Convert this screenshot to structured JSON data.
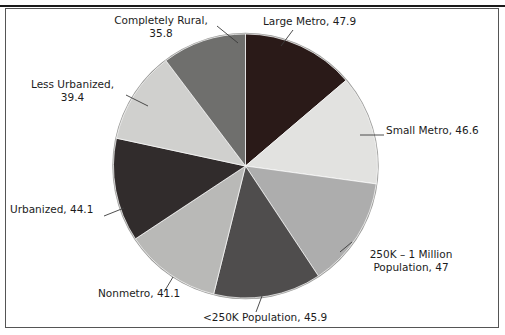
{
  "figure": {
    "clipped_header_text": "",
    "background_color": "#ffffff",
    "frame_color": "#555555"
  },
  "chart_data": {
    "type": "pie",
    "title": "",
    "subtitle": "",
    "xlabel": "",
    "ylabel": "",
    "grid": false,
    "legend_position": "none",
    "label_format": "{category}, {value}",
    "start_angle_deg": 0,
    "direction": "clockwise",
    "total": 347.8,
    "categories": [
      "Large Metro",
      "Small Metro",
      "250K – 1 Million Population",
      "<250K Population",
      "Nonmetro",
      "Urbanized",
      "Less Urbanized",
      "Completely Rural"
    ],
    "values": [
      47.9,
      46.6,
      47,
      45.9,
      41.1,
      44.1,
      39.4,
      35.8
    ],
    "colors": [
      "#2a1a18",
      "#e2e2e0",
      "#adadad",
      "#4f4d4d",
      "#b9b9b7",
      "#312c2c",
      "#d0d0ce",
      "#6f6f6d"
    ],
    "slices": [
      {
        "name": "large-metro",
        "label": "Large Metro, 47.9",
        "category": "Large Metro",
        "value": 47.9,
        "color": "#2a1a18",
        "percent": 13.8
      },
      {
        "name": "small-metro",
        "label": "Small Metro, 46.6",
        "category": "Small Metro",
        "value": 46.6,
        "color": "#e2e2e0",
        "percent": 13.4
      },
      {
        "name": "250k-1-million-population",
        "label_line1": "250K – 1 Million",
        "label_line2": "Population, 47",
        "category": "250K – 1 Million Population",
        "value": 47,
        "color": "#adadad",
        "percent": 13.5
      },
      {
        "name": "under-250k-population",
        "label": "<250K Population, 45.9",
        "category": "<250K Population",
        "value": 45.9,
        "color": "#4f4d4d",
        "percent": 13.2
      },
      {
        "name": "nonmetro",
        "label": "Nonmetro, 41.1",
        "category": "Nonmetro",
        "value": 41.1,
        "color": "#b9b9b7",
        "percent": 11.8
      },
      {
        "name": "urbanized",
        "label": "Urbanized, 44.1",
        "category": "Urbanized",
        "value": 44.1,
        "color": "#312c2c",
        "percent": 12.7
      },
      {
        "name": "less-urbanized",
        "label_line1": "Less Urbanized,",
        "label_line2": "39.4",
        "category": "Less Urbanized",
        "value": 39.4,
        "color": "#d0d0ce",
        "percent": 11.3
      },
      {
        "name": "completely-rural",
        "label_line1": "Completely Rural,",
        "label_line2": "35.8",
        "category": "Completely Rural",
        "value": 35.8,
        "color": "#6f6f6d",
        "percent": 10.3
      }
    ]
  }
}
